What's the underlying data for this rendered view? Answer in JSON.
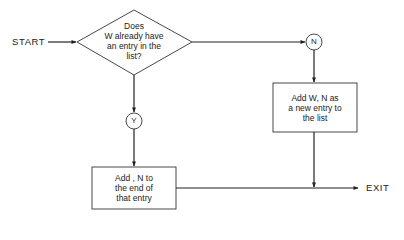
{
  "diagram": {
    "type": "flowchart",
    "start_label": "START",
    "exit_label": "EXIT",
    "decision": {
      "lines": [
        "Does",
        "W already have",
        "an entry in the",
        "list?"
      ]
    },
    "connectors": {
      "yes": "Y",
      "no": "N"
    },
    "process_yes": {
      "lines": [
        "Add , N to",
        "the end of",
        "that entry"
      ]
    },
    "process_no": {
      "lines": [
        "Add W, N as",
        "a new entry to",
        "the list"
      ]
    },
    "edges": [
      {
        "from": "START",
        "to": "decision"
      },
      {
        "from": "decision",
        "to": "Y",
        "direction": "down"
      },
      {
        "from": "Y",
        "to": "process_yes"
      },
      {
        "from": "decision",
        "to": "N",
        "direction": "right"
      },
      {
        "from": "N",
        "to": "process_no"
      },
      {
        "from": "process_yes",
        "to": "EXIT"
      },
      {
        "from": "process_no",
        "to": "EXIT"
      }
    ],
    "colors": {
      "stroke": "#222222",
      "background": "#ffffff"
    }
  }
}
